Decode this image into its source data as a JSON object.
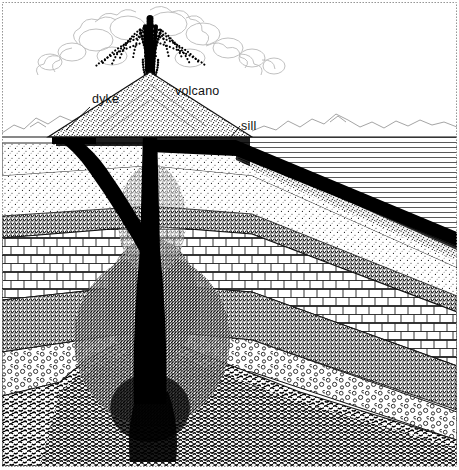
{
  "figure": {
    "kind": "geological-cross-section",
    "style": "pen-and-ink line drawing, black on white",
    "width": 459,
    "height": 470,
    "border_color": "#8a8a8a",
    "ink_color": "#000000",
    "background_color": "#ffffff"
  },
  "labels": [
    {
      "id": "dyke",
      "text": "dyke",
      "x": 92,
      "y": 103,
      "leader": true
    },
    {
      "id": "volcano",
      "text": "volcano",
      "x": 175,
      "y": 95,
      "leader": false
    },
    {
      "id": "sill",
      "text": "sill",
      "x": 241,
      "y": 130,
      "leader": true
    }
  ],
  "features": {
    "eruption_plume": {
      "name": "ash-eruption-column",
      "center_x": 150,
      "top_y": 4,
      "base_y": 92,
      "description": "dark fountaining ash jet with pale billowing cloud lobes spreading sideways"
    },
    "volcano_cone": {
      "name": "volcano-cone",
      "apex_x": 150,
      "apex_y": 72,
      "left_base_x": 55,
      "right_base_x": 250,
      "base_y": 137,
      "fill": "stipple"
    },
    "conduit": {
      "name": "magma-conduit",
      "x": 150,
      "top_y": 70,
      "bottom_y": 400,
      "width_top": 13,
      "width_bottom": 30
    },
    "dyke": {
      "name": "dyke-intrusion",
      "from_x": 150,
      "from_y": 255,
      "to_x": 62,
      "to_y": 133
    },
    "sill": {
      "name": "sill-intrusion",
      "from_x": 240,
      "from_y": 150,
      "to_x": 459,
      "to_y": 243
    },
    "horizon": {
      "name": "ground-surface",
      "y": 137
    },
    "skyline": {
      "name": "distant-mountains",
      "y": 120
    }
  },
  "strata": [
    {
      "id": "shale",
      "name": "shale-horizontal-hatch",
      "pattern": "horizontal-lines",
      "tone": "light"
    },
    {
      "id": "sandstone-up",
      "name": "upper-sandstone",
      "pattern": "fine-stipple",
      "tone": "light"
    },
    {
      "id": "sandstone-dk",
      "name": "dark-sandstone",
      "pattern": "dense-stipple",
      "tone": "dark"
    },
    {
      "id": "limestone",
      "name": "limestone-brick",
      "pattern": "brick",
      "tone": "white"
    },
    {
      "id": "siltstone",
      "name": "dark-siltstone",
      "pattern": "dense-stipple",
      "tone": "dark"
    },
    {
      "id": "conglomerate",
      "name": "conglomerate-pebbles",
      "pattern": "circles",
      "tone": "light"
    },
    {
      "id": "basement",
      "name": "basement-rock",
      "pattern": "dashes",
      "tone": "dark"
    }
  ]
}
